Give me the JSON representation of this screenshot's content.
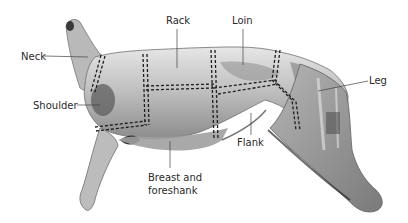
{
  "diagram": {
    "colors": {
      "background": "#ffffff",
      "carcass_light": "#d9d9d9",
      "carcass_mid": "#a8a8a8",
      "carcass_dark": "#5c5c5c",
      "cut_line": "#1e1e1e",
      "leader_line": "#444444",
      "label_text": "#2a2a2a"
    },
    "labels": [
      {
        "id": "neck",
        "text": "Neck",
        "x": 21,
        "y": 48,
        "anchor": [
          88,
          57
        ]
      },
      {
        "id": "rack",
        "text": "Rack",
        "x": 167,
        "y": 14,
        "anchor": [
          177,
          68
        ]
      },
      {
        "id": "loin",
        "text": "Loin",
        "x": 232,
        "y": 14,
        "anchor": [
          243,
          65
        ]
      },
      {
        "id": "leg",
        "text": "Leg",
        "x": 370,
        "y": 73,
        "anchor": [
          318,
          91
        ]
      },
      {
        "id": "shoulder",
        "text": "Shoulder",
        "x": 33,
        "y": 98,
        "anchor": [
          100,
          105
        ]
      },
      {
        "id": "flank",
        "text": "Flank",
        "x": 239,
        "y": 137,
        "anchor": [
          251,
          113
        ]
      },
      {
        "id": "breast",
        "text": "Breast and\nforeshank",
        "x": 148,
        "y": 171,
        "anchor": [
          170,
          141
        ]
      }
    ]
  }
}
